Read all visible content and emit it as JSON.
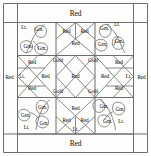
{
  "diagram": {
    "type": "quilt-block",
    "fabric_labels": {
      "red": "Red",
      "gold": "Gold",
      "light": "Lt.",
      "green": "Grn."
    },
    "borders": {
      "top": "Red",
      "bottom": "Red",
      "left": "Red",
      "right": "Red"
    },
    "corners": [
      {
        "position": "top-left",
        "light": "Lt.",
        "leaves": [
          "Grn.",
          "Grn.",
          "Grn."
        ]
      },
      {
        "position": "top-right",
        "light": "Lt.",
        "leaves": [
          "Grn.",
          "Grn.",
          "Grn."
        ]
      },
      {
        "position": "bottom-left",
        "light": "Lt.",
        "leaves": [
          "Grn.",
          "Grn.",
          "Grn."
        ]
      },
      {
        "position": "bottom-right",
        "light": "Lt.",
        "leaves": [
          "Grn.",
          "Grn.",
          "Grn."
        ]
      }
    ],
    "edge_units": [
      {
        "position": "top-center",
        "pieces": [
          "Red",
          "Red",
          "Red"
        ]
      },
      {
        "position": "bottom-center",
        "pieces": [
          "Red",
          "Red",
          "Red",
          "Lt."
        ]
      },
      {
        "position": "left-center",
        "pieces": [
          "Red",
          "Lt.",
          "Red"
        ]
      },
      {
        "position": "right-center",
        "pieces": [
          "Red",
          "Lt.",
          "Red"
        ]
      }
    ],
    "center_grid": {
      "rows": [
        {
          "cells": [
            "Gold",
            "Gold"
          ]
        },
        {
          "cells": [
            "Red",
            "Red",
            "Red"
          ]
        },
        {
          "cells": [
            "Gold",
            "Gold"
          ]
        }
      ]
    },
    "labels": [
      {
        "text": "Red",
        "x": 75.5,
        "y": 13.5,
        "size": "big",
        "name": "border-label-top"
      },
      {
        "text": "Red",
        "x": 75.5,
        "y": 143.5,
        "size": "big",
        "name": "border-label-bottom"
      },
      {
        "text": "Red",
        "x": 9.5,
        "y": 78.0,
        "size": "sm",
        "name": "border-label-left"
      },
      {
        "text": "Red",
        "x": 141.5,
        "y": 78.0,
        "size": "sm",
        "name": "border-label-right"
      },
      {
        "text": "Lt.",
        "x": 24.0,
        "y": 28.0,
        "size": "sm",
        "name": "corner-light-top-left"
      },
      {
        "text": "Grn.",
        "x": 39.0,
        "y": 30.0,
        "size": "sm",
        "name": "leaf-top-left-a"
      },
      {
        "text": "Grn.",
        "x": 28.0,
        "y": 47.0,
        "size": "sm",
        "name": "leaf-top-left-b"
      },
      {
        "text": "Grn.",
        "x": 42.0,
        "y": 49.0,
        "size": "sm",
        "name": "leaf-top-left-c"
      },
      {
        "text": "Lt.",
        "x": 117.0,
        "y": 24.5,
        "size": "sm",
        "name": "corner-light-top-right"
      },
      {
        "text": "Grn.",
        "x": 104.5,
        "y": 29.0,
        "size": "sm",
        "name": "leaf-top-right-a"
      },
      {
        "text": "Grn.",
        "x": 119.0,
        "y": 42.0,
        "size": "sm",
        "name": "leaf-top-right-b"
      },
      {
        "text": "Grn.",
        "x": 102.5,
        "y": 45.0,
        "size": "sm",
        "name": "leaf-top-right-c"
      },
      {
        "text": "Lt.",
        "x": 26.5,
        "y": 128.0,
        "size": "sm",
        "name": "corner-light-bottom-left"
      },
      {
        "text": "Grn.",
        "x": 42.5,
        "y": 108.0,
        "size": "sm",
        "name": "leaf-bottom-left-a"
      },
      {
        "text": "Grn.",
        "x": 25.5,
        "y": 115.5,
        "size": "sm",
        "name": "leaf-bottom-left-b"
      },
      {
        "text": "Grn.",
        "x": 44.0,
        "y": 124.0,
        "size": "sm",
        "name": "leaf-bottom-left-c"
      },
      {
        "text": "Grn.",
        "x": 104.0,
        "y": 106.5,
        "size": "sm",
        "name": "leaf-bottom-right-a"
      },
      {
        "text": "Grn.",
        "x": 120.0,
        "y": 110.0,
        "size": "sm",
        "name": "leaf-bottom-right-b"
      },
      {
        "text": "Grn.",
        "x": 107.5,
        "y": 122.0,
        "size": "sm",
        "name": "leaf-bottom-right-c"
      },
      {
        "text": "Lt.",
        "x": 121.0,
        "y": 122.0,
        "size": "sm",
        "name": "corner-light-bottom-right"
      },
      {
        "text": "Red",
        "x": 66.5,
        "y": 31.5,
        "size": "sm",
        "name": "top-unit-red-left"
      },
      {
        "text": "Red",
        "x": 84.5,
        "y": 31.5,
        "size": "sm",
        "name": "top-unit-red-right"
      },
      {
        "text": "Red",
        "x": 75.5,
        "y": 44.0,
        "size": "sm",
        "name": "top-unit-red-center"
      },
      {
        "text": "Gold",
        "x": 58.0,
        "y": 61.0,
        "size": "sm",
        "name": "gold-diamond-top-left"
      },
      {
        "text": "Gold",
        "x": 93.0,
        "y": 61.0,
        "size": "sm",
        "name": "gold-diamond-top-right"
      },
      {
        "text": "Red",
        "x": 32.0,
        "y": 62.5,
        "size": "sm",
        "name": "left-unit-red-top"
      },
      {
        "text": "Lt.",
        "x": 22.0,
        "y": 76.5,
        "size": "sm",
        "name": "left-unit-light"
      },
      {
        "text": "Red",
        "x": 32.0,
        "y": 89.0,
        "size": "sm",
        "name": "left-unit-red-bottom"
      },
      {
        "text": "Red",
        "x": 45.5,
        "y": 76.5,
        "size": "sm",
        "name": "center-red-left"
      },
      {
        "text": "Red",
        "x": 75.5,
        "y": 76.5,
        "size": "sm",
        "name": "center-red-middle"
      },
      {
        "text": "Red",
        "x": 105.0,
        "y": 76.5,
        "size": "sm",
        "name": "center-red-right"
      },
      {
        "text": "Red",
        "x": 119.0,
        "y": 62.5,
        "size": "sm",
        "name": "right-unit-red-top"
      },
      {
        "text": "Lt.",
        "x": 128.5,
        "y": 76.5,
        "size": "sm",
        "name": "right-unit-light"
      },
      {
        "text": "Red",
        "x": 119.0,
        "y": 89.0,
        "size": "sm",
        "name": "right-unit-red-bottom"
      },
      {
        "text": "Gold",
        "x": 58.0,
        "y": 91.5,
        "size": "sm",
        "name": "gold-diamond-bottom-left"
      },
      {
        "text": "Gold",
        "x": 93.0,
        "y": 91.5,
        "size": "sm",
        "name": "gold-diamond-bottom-right"
      },
      {
        "text": "Red",
        "x": 75.5,
        "y": 108.5,
        "size": "sm",
        "name": "bottom-unit-red-center"
      },
      {
        "text": "Red",
        "x": 66.5,
        "y": 120.5,
        "size": "sm",
        "name": "bottom-unit-red-left"
      },
      {
        "text": "Red",
        "x": 84.5,
        "y": 120.5,
        "size": "sm",
        "name": "bottom-unit-red-right"
      },
      {
        "text": "Lt.",
        "x": 75.5,
        "y": 129.5,
        "size": "sm",
        "name": "bottom-unit-light"
      }
    ]
  }
}
